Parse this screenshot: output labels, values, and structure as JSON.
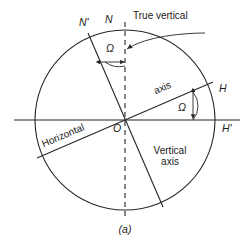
{
  "figure": {
    "caption": "(a)",
    "stroke_color": "#262626",
    "text_color": "#1a1a1a",
    "background": "#ffffff"
  },
  "labels": {
    "n_prime": "N'",
    "n": "N",
    "true_vertical": "True vertical",
    "omega_top": "Ω",
    "omega_right": "Ω",
    "axis": "axis",
    "h": "H",
    "h_prime": "H'",
    "horizontal": "Horizontal",
    "origin": "O",
    "vertical_line1": "Vertical",
    "vertical_line2": "axis"
  },
  "geometry": {
    "circle_center_x": 125,
    "circle_center_y": 120,
    "circle_radius": 90,
    "tilt_angle_deg": 12
  }
}
